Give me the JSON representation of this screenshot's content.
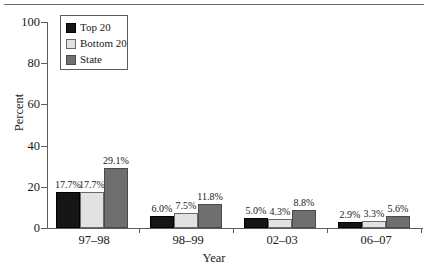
{
  "chart_data": {
    "type": "bar",
    "title": "",
    "xlabel": "Year",
    "ylabel": "Percent",
    "ylim": [
      0,
      100
    ],
    "yticks": [
      0,
      20,
      40,
      60,
      80,
      100
    ],
    "ytick_labels": [
      "0",
      "20",
      "40",
      "60",
      "80",
      "100"
    ],
    "grid": false,
    "legend_position": "top-left inside",
    "categories": [
      "97–98",
      "98–99",
      "02–03",
      "06–07"
    ],
    "series": [
      {
        "name": "Top 20",
        "color": "#151515",
        "values": [
          17.7,
          6.0,
          5.0,
          2.9
        ],
        "labels": [
          "17.7%",
          "6.0%",
          "5.0%",
          "2.9%"
        ]
      },
      {
        "name": "Bottom 20",
        "color": "#e2e2e2",
        "values": [
          17.7,
          7.5,
          4.3,
          3.3
        ],
        "labels": [
          "17.7%",
          "7.5%",
          "4.3%",
          "3.3%"
        ]
      },
      {
        "name": "State",
        "color": "#6f6f6f",
        "values": [
          29.1,
          11.8,
          8.8,
          5.6
        ],
        "labels": [
          "29.1%",
          "11.8%",
          "8.8%",
          "5.6%"
        ]
      }
    ]
  },
  "legend": {
    "items": [
      {
        "label": "Top 20"
      },
      {
        "label": "Bottom 20"
      },
      {
        "label": "State"
      }
    ]
  },
  "axes": {
    "y_title": "Percent",
    "x_title": "Year"
  }
}
